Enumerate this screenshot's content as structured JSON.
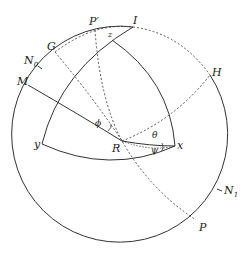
{
  "figure": {
    "type": "spherical-geometry-diagram",
    "outer_circle": {
      "cx": 123,
      "cy": 138,
      "r": 108
    },
    "labels": {
      "I": "I",
      "P_prime": "P′",
      "z": "z",
      "G": "G",
      "N0": "N",
      "N0_sub": "0",
      "M": "M",
      "H": "H",
      "y": "y",
      "R": "R",
      "x": "x",
      "theta": "θ",
      "psi": "ψ",
      "phi": "ϕ",
      "N1": "N",
      "N1_sub": "1",
      "P": "P"
    },
    "colors": {
      "stroke": "#333333",
      "dashed": "#444444",
      "background": "#ffffff"
    }
  }
}
